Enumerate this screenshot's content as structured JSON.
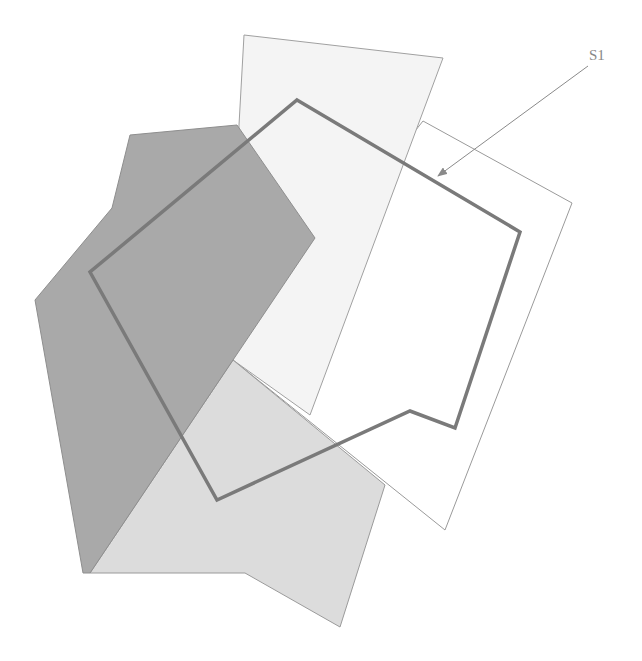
{
  "diagram": {
    "title": "",
    "labels": [
      {
        "id": "S1",
        "text": "S1",
        "target": "hexagon-outline"
      }
    ],
    "shapes": [
      {
        "id": "tall-light-quad",
        "kind": "filled-polygon",
        "shade": "very-light"
      },
      {
        "id": "right-outline-quad",
        "kind": "outlined-polygon",
        "shade": "none"
      },
      {
        "id": "dark-polygon",
        "kind": "filled-polygon",
        "shade": "dark"
      },
      {
        "id": "light-bottom-polygon",
        "kind": "filled-polygon",
        "shade": "light"
      },
      {
        "id": "hexagon-outline",
        "kind": "thick-outline",
        "shade": "none",
        "label": "S1"
      }
    ],
    "colors": {
      "background": "#ffffff",
      "very_light_fill": "#f3f3f3",
      "light_fill": "#d9d9d9",
      "dark_fill": "#a8a8a8",
      "thin_stroke": "#9a9a9a",
      "thick_stroke": "#7a7a7a",
      "label": "#888888"
    }
  }
}
